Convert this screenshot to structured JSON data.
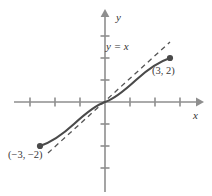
{
  "figure": {
    "background_color": "#ffffff",
    "width": 212,
    "height": 196
  },
  "axes": {
    "x_axis_label": "x",
    "y_axis_label": "y",
    "axis_color": "#8e8e8e",
    "origin_px": {
      "x": 105,
      "y": 102
    },
    "x_unit_px": 25,
    "y_unit_px": 22,
    "x_tick_values": [
      -3,
      -2,
      -1,
      1,
      2,
      3
    ],
    "y_tick_values": [
      -3,
      -2,
      -1,
      1,
      2,
      3
    ],
    "x_range_px": {
      "start": 14,
      "end": 202
    },
    "y_range_px": {
      "start": 10,
      "end": 192
    },
    "tick_half_length_px": 4
  },
  "reference_line": {
    "label": "y = x",
    "style": "dashed",
    "color": "#555555",
    "slope": 1,
    "intercept": 0,
    "x_from": -2.3,
    "x_to": 2.6
  },
  "curve": {
    "color": "#4a4a4a",
    "style": "solid",
    "description": "odd, increasing, concave-down for x>0, passing through the origin",
    "endpoints": [
      {
        "label": "(-3, -2)",
        "x": -3,
        "y": -2
      },
      {
        "label": "(3, 2)",
        "x": 3,
        "y": 2
      }
    ],
    "sample_points": [
      {
        "x": -3,
        "y": -2
      },
      {
        "x": -2.4,
        "y": -1.78
      },
      {
        "x": -1.8,
        "y": -1.48
      },
      {
        "x": -1.2,
        "y": -1.1
      },
      {
        "x": -0.6,
        "y": -0.6
      },
      {
        "x": 0,
        "y": 0
      },
      {
        "x": 0.6,
        "y": 0.6
      },
      {
        "x": 1.2,
        "y": 1.1
      },
      {
        "x": 1.8,
        "y": 1.48
      },
      {
        "x": 2.4,
        "y": 1.78
      },
      {
        "x": 3,
        "y": 2
      }
    ]
  },
  "point_markers": [
    {
      "name": "endpoint-positive",
      "label": "(3, 2)",
      "x": 3,
      "y": 2,
      "radius_px": 3,
      "color": "#4a4a4a"
    },
    {
      "name": "endpoint-negative",
      "label": "(−3, −2)",
      "x": -3,
      "y": -2,
      "radius_px": 3,
      "color": "#4a4a4a"
    }
  ],
  "labels": {
    "y_axis": "y",
    "x_axis": "x",
    "equation": "y = x",
    "point_positive": "(3, 2)",
    "point_negative": "(−3, −2)"
  }
}
